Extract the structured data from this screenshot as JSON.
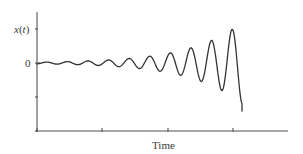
{
  "chart_data": {
    "type": "line",
    "title": "",
    "xlabel": "Time",
    "ylabel": "x(t)",
    "y_tick_labels": [
      "x(t)",
      "0"
    ],
    "x_tick_labels": [],
    "grid": false,
    "legend": null,
    "series": [
      {
        "name": "x(t)",
        "model": "A0 * exp(growth * t) * sin(2*pi*t/period)",
        "x": [
          0,
          10,
          20,
          31,
          41,
          51,
          62,
          72,
          82,
          93,
          103,
          114,
          124,
          134,
          144,
          154,
          164,
          174,
          185,
          195,
          205
        ],
        "y": [
          0,
          0.3,
          -0.4,
          0.4,
          -0.5,
          0.6,
          -0.8,
          0.9,
          -1.1,
          1.3,
          -1.5,
          1.8,
          -2.2,
          2.6,
          -3.1,
          3.7,
          -4.5,
          5.4,
          -6.5,
          7.8,
          -9.4
        ],
        "peaks_px": [
          [
            151,
            56
          ],
          [
            171,
            53
          ],
          [
            191,
            47
          ],
          [
            211,
            39
          ],
          [
            232,
            24
          ]
        ],
        "troughs_px": [
          [
            161,
            71
          ],
          [
            181,
            75
          ],
          [
            201,
            82
          ],
          [
            222,
            93
          ]
        ],
        "end_px": [
          242,
          111
        ]
      }
    ],
    "axes": {
      "origin_px": [
        37,
        131
      ],
      "x_end_px": 288,
      "y_top_px": 12,
      "zero_line_px": 63,
      "x_ticks_px": [
        37,
        102,
        168,
        233
      ],
      "y_ticks_px": [
        29,
        63,
        97,
        131
      ]
    },
    "curve_params": {
      "x_start": 37,
      "x_end": 242,
      "baseline_y": 63,
      "period_px": 20.6,
      "phase_px": 10,
      "amp_at_end": 41,
      "growth_per_px": 0.0195,
      "min_amp": 0.9
    },
    "colors": {
      "axis": "#555555",
      "curve": "#333333",
      "text": "#3a3a3a"
    }
  },
  "labels": {
    "ylabel_var": "x",
    "ylabel_open": "(",
    "ylabel_arg": "t",
    "ylabel_close": ")",
    "zero": "0",
    "xlabel": "Time"
  }
}
